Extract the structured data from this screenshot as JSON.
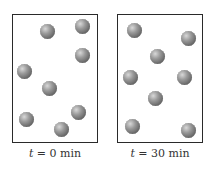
{
  "panels": [
    {
      "label_var": "t",
      "label_rest": " = 0 min",
      "box": {
        "x": 12,
        "y": 14,
        "w": 86,
        "h": 129
      },
      "particles": [
        [
          47,
          31
        ],
        [
          82,
          26
        ],
        [
          82,
          55
        ],
        [
          24,
          71
        ],
        [
          49,
          88
        ],
        [
          78,
          112
        ],
        [
          26,
          119
        ],
        [
          61,
          129
        ]
      ]
    },
    {
      "label_var": "t",
      "label_rest": " = 30 min",
      "box": {
        "x": 117,
        "y": 14,
        "w": 86,
        "h": 129
      },
      "particles": [
        [
          134,
          30
        ],
        [
          188,
          38
        ],
        [
          157,
          56
        ],
        [
          130,
          77
        ],
        [
          184,
          77
        ],
        [
          155,
          98
        ],
        [
          132,
          126
        ],
        [
          188,
          130
        ]
      ]
    }
  ],
  "colors": {
    "border": "#2a2a2a",
    "particle": "#7a7a7a"
  }
}
